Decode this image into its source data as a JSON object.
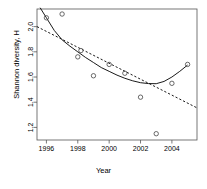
{
  "chart_data": {
    "type": "scatter",
    "title": "",
    "xlabel": "Year",
    "ylabel": "Shannon diversity, H",
    "xlim": [
      1995.4,
      2005.6
    ],
    "ylim": [
      1.1,
      2.14
    ],
    "xticks": [
      1996,
      1998,
      2000,
      2002,
      2004
    ],
    "xticklabels": [
      "1996",
      "1998",
      "2000",
      "2002",
      "2004"
    ],
    "yticks": [
      1.2,
      1.4,
      1.6,
      1.8,
      2.0
    ],
    "yticklabels": [
      "1.2",
      "1.4",
      "1.6",
      "1.8",
      "2.0"
    ],
    "grid": false,
    "legend": "none",
    "point_marker": "open-circle",
    "points": [
      {
        "x": 1996.0,
        "y": 2.07
      },
      {
        "x": 1997.0,
        "y": 2.1
      },
      {
        "x": 1998.0,
        "y": 1.76
      },
      {
        "x": 1998.2,
        "y": 1.81
      },
      {
        "x": 1999.0,
        "y": 1.61
      },
      {
        "x": 2000.0,
        "y": 1.7
      },
      {
        "x": 2001.0,
        "y": 1.63
      },
      {
        "x": 2002.0,
        "y": 1.44
      },
      {
        "x": 2003.0,
        "y": 1.15
      },
      {
        "x": 2004.0,
        "y": 1.55
      },
      {
        "x": 2005.0,
        "y": 1.7
      }
    ],
    "series": [
      {
        "name": "smoothed-trend",
        "style": "solid",
        "color": "#000000",
        "x": [
          1995.6,
          1996.0,
          1996.5,
          1997.0,
          1997.5,
          1998.0,
          1998.5,
          1999.0,
          1999.5,
          2000.0,
          2000.5,
          2001.0,
          2001.5,
          2002.0,
          2002.5,
          2003.0,
          2003.5,
          2004.0,
          2004.5,
          2005.0
        ],
        "y": [
          2.15,
          2.07,
          1.97,
          1.895,
          1.845,
          1.8,
          1.755,
          1.715,
          1.675,
          1.645,
          1.615,
          1.59,
          1.57,
          1.555,
          1.548,
          1.547,
          1.565,
          1.6,
          1.645,
          1.695
        ]
      },
      {
        "name": "linear-regression",
        "style": "dashed",
        "color": "#000000",
        "x": [
          1995.4,
          2005.6
        ],
        "y": [
          2.0,
          1.355
        ]
      }
    ]
  },
  "axes": {
    "ylabel": "Shannon diversity, H",
    "xlabel": "Year"
  }
}
